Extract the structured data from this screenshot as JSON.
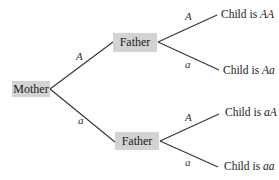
{
  "tree": {
    "root": {
      "label": "Mother"
    },
    "branches": [
      {
        "edge_label": "A",
        "node": {
          "label": "Father"
        },
        "children": [
          {
            "edge_label": "A",
            "prefix": "Child is ",
            "genotype": "AA"
          },
          {
            "edge_label": "a",
            "prefix": "Child is ",
            "genotype": "Aa"
          }
        ]
      },
      {
        "edge_label": "a",
        "node": {
          "label": "Father"
        },
        "children": [
          {
            "edge_label": "A",
            "prefix": "Child is ",
            "genotype": "aA"
          },
          {
            "edge_label": "a",
            "prefix": "Child is ",
            "genotype": "aa"
          }
        ]
      }
    ]
  },
  "colors": {
    "box_fill": "#d3d3d3",
    "line": "#333333"
  }
}
